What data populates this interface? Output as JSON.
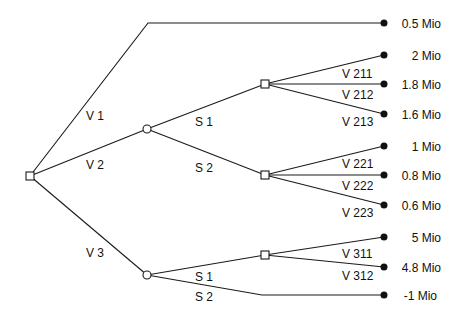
{
  "diagram": {
    "type": "decision-tree",
    "root": {
      "id": "D0",
      "kind": "decision",
      "x": 30,
      "y": 176
    },
    "branches": [
      {
        "id": "V1",
        "label": "V 1",
        "label_pos": [
          86,
          116
        ],
        "outcome": "0.5 Mio",
        "y": 23
      },
      {
        "id": "V2",
        "label": "V 2",
        "label_pos": [
          86,
          168
        ]
      },
      {
        "id": "V3",
        "label": "V 3",
        "label_pos": [
          86,
          257
        ]
      }
    ],
    "chance_nodes": [
      {
        "id": "C2",
        "parent": "V2",
        "x": 147,
        "y": 129
      },
      {
        "id": "C3",
        "parent": "V3",
        "x": 147,
        "y": 275
      }
    ],
    "states": [
      {
        "id": "S1a",
        "label": "S 1",
        "label_pos": [
          195,
          125
        ],
        "from": "C2"
      },
      {
        "id": "S2a",
        "label": "S 2",
        "label_pos": [
          195,
          171
        ],
        "from": "C2"
      },
      {
        "id": "S1b",
        "label": "S 1",
        "label_pos": [
          195,
          280
        ],
        "from": "C3"
      },
      {
        "id": "S2b",
        "label": "S 2",
        "label_pos": [
          195,
          300
        ],
        "from": "C3"
      }
    ],
    "decision_nodes": [
      {
        "id": "D1",
        "x": 265,
        "y": 84,
        "options": [
          {
            "label": "V 211",
            "outcome": "2 Mio",
            "y": 55
          },
          {
            "label": "V 212",
            "outcome": "1.8 Mio",
            "y": 84
          },
          {
            "label": "V 213",
            "outcome": "1.6 Mio",
            "y": 114
          }
        ]
      },
      {
        "id": "D2",
        "x": 265,
        "y": 175,
        "options": [
          {
            "label": "V 221",
            "outcome": "1 Mio",
            "y": 146
          },
          {
            "label": "V 222",
            "outcome": "0.8 Mio",
            "y": 175
          },
          {
            "label": "V 223",
            "outcome": "0.6 Mio",
            "y": 205
          }
        ]
      },
      {
        "id": "D3",
        "x": 265,
        "y": 255,
        "options": [
          {
            "label": "V 311",
            "outcome": "5 Mio",
            "y": 237
          },
          {
            "label": "V 312",
            "outcome": "4.8 Mio",
            "y": 267
          }
        ]
      }
    ],
    "direct_outcome_S2b": {
      "outcome": "-1 Mio",
      "y": 295
    },
    "labels": {
      "v1": "V 1",
      "v2": "V 2",
      "v3": "V 3",
      "s1_top": "S 1",
      "s2_top": "S 2",
      "s1_bot": "S 1",
      "s2_bot": "S 2",
      "v211": "V 211",
      "v212": "V 212",
      "v213": "V 213",
      "v221": "V 221",
      "v222": "V 222",
      "v223": "V 223",
      "v311": "V 311",
      "v312": "V 312"
    },
    "outcomes": {
      "o_v1": "0.5 Mio",
      "o_v211": "2 Mio",
      "o_v212": "1.8 Mio",
      "o_v213": "1.6 Mio",
      "o_v221": "1 Mio",
      "o_v222": "0.8 Mio",
      "o_v223": "0.6 Mio",
      "o_v311": "5 Mio",
      "o_v312": "4.8 Mio",
      "o_s2b": "-1 Mio"
    }
  }
}
